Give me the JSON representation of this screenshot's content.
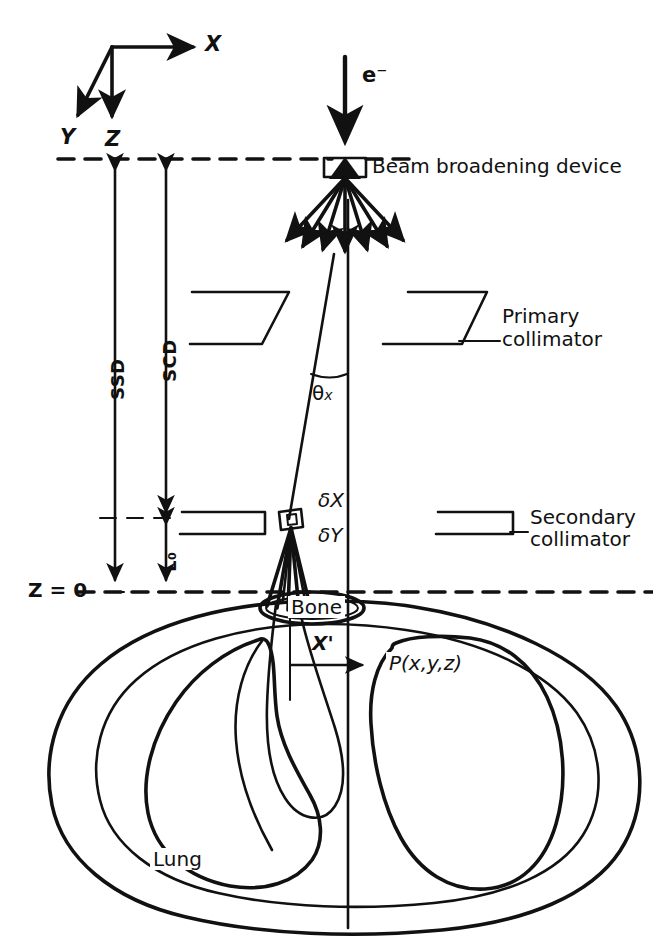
{
  "figure": {
    "background_color": "#ffffff",
    "ink_color": "#111111"
  },
  "axes": {
    "x_label": "X",
    "y_label": "Y",
    "z_label": "Z"
  },
  "beam": {
    "source_label": "e⁻",
    "device_label": "Beam broadening device",
    "angle_label": "θ",
    "angle_sub": "x",
    "delta_x_label": "δX",
    "delta_y_label": "δY"
  },
  "collimators": {
    "primary_line1": "Primary",
    "primary_line2": "collimator",
    "secondary_line1": "Secondary",
    "secondary_line2": "collimator"
  },
  "distances": {
    "ssd": "SSD",
    "scd": "SCD",
    "l0": "L₀"
  },
  "plane": {
    "z_zero_label": "Z = 0"
  },
  "anatomy": {
    "bone_label": "Bone",
    "lung_label": "Lung",
    "point_label": "P(x,y,z)",
    "xprime_label": "X'"
  }
}
